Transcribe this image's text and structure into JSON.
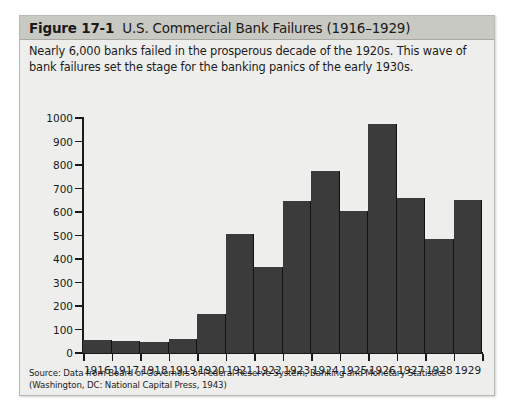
{
  "figure": {
    "number": "Figure 17-1",
    "title": "U.S. Commercial Bank Failures (1916–1929)",
    "caption": "Nearly 6,000 banks failed in the prosperous decade of the 1920s. This wave of bank failures set the stage for the banking panics of the early 1930s.",
    "source": "Source: Data from Board of Governors of Federal Reserve System, Banking and Monetary Statistics (Washington, DC: National Capital Press, 1943)"
  },
  "colors": {
    "bar_fill": "#3b3b3b",
    "header_band": "#c9c9c4",
    "panel_background": "#eeeeec",
    "axis": "#1a1a1a"
  },
  "chart_data": {
    "type": "bar",
    "title": "U.S. Commercial Bank Failures (1916–1929)",
    "xlabel": "",
    "ylabel": "",
    "categories": [
      "1916",
      "1917",
      "1918",
      "1919",
      "1920",
      "1921",
      "1922",
      "1923",
      "1924",
      "1925",
      "1926",
      "1927",
      "1928",
      "1929"
    ],
    "values": [
      55,
      50,
      48,
      58,
      168,
      505,
      365,
      645,
      775,
      605,
      975,
      660,
      485,
      650
    ],
    "ylim": [
      0,
      1000
    ],
    "yticks": [
      0,
      100,
      200,
      300,
      400,
      500,
      600,
      700,
      800,
      900,
      1000
    ],
    "ytick_labels": [
      "0",
      "100",
      "200",
      "300",
      "400",
      "500",
      "600",
      "700",
      "800",
      "900",
      "1000"
    ],
    "grid": false,
    "legend": null
  }
}
